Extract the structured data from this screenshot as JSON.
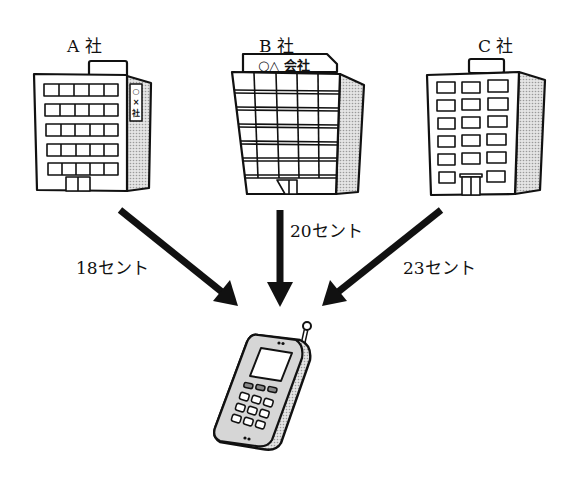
{
  "companies": [
    {
      "id": "a",
      "label": "A 社",
      "sign": "○×社"
    },
    {
      "id": "b",
      "label": "B 社",
      "sign": "○△ 会社"
    },
    {
      "id": "c",
      "label": "C 社"
    }
  ],
  "prices": [
    {
      "from": "a",
      "label": "18セント"
    },
    {
      "from": "b",
      "label": "20セント"
    },
    {
      "from": "c",
      "label": "23セント"
    }
  ],
  "target": {
    "icon": "mobile-phone-icon"
  },
  "colors": {
    "line": "#111111",
    "shade": "#b8b8b8",
    "phone_body": "#d6d6d6",
    "background": "#ffffff"
  }
}
